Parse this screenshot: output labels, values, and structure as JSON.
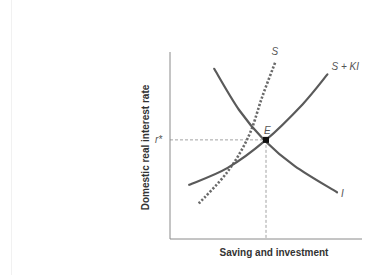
{
  "chart_data": {
    "type": "line",
    "title": "",
    "xlabel": "Saving and investment",
    "ylabel": "Domestic real interest rate",
    "xlim": [
      0,
      10
    ],
    "ylim": [
      0,
      10
    ],
    "grid": false,
    "legend": "none (curves labeled inline)",
    "series": [
      {
        "name": "I",
        "label": "I",
        "style": "solid",
        "description": "Investment demand, downward sloping",
        "points": [
          [
            2.3,
            9.1
          ],
          [
            3.6,
            6.9
          ],
          [
            4.9,
            5.3
          ],
          [
            6.5,
            3.9
          ],
          [
            8.7,
            2.5
          ]
        ]
      },
      {
        "name": "S",
        "label": "S",
        "style": "dotted",
        "description": "Domestic saving supply, steep upward sloping",
        "points": [
          [
            1.5,
            1.9
          ],
          [
            3.0,
            3.6
          ],
          [
            4.1,
            5.5
          ],
          [
            4.8,
            7.6
          ],
          [
            5.5,
            9.5
          ]
        ]
      },
      {
        "name": "S + KI",
        "label": "S + KI",
        "style": "solid",
        "description": "Saving plus capital inflows, flatter upward sloping",
        "points": [
          [
            1.0,
            2.9
          ],
          [
            3.0,
            3.8
          ],
          [
            5.0,
            5.3
          ],
          [
            6.9,
            7.2
          ],
          [
            8.2,
            8.8
          ]
        ]
      }
    ],
    "annotations": [
      {
        "type": "point",
        "label": "E",
        "x": 5.0,
        "y": 5.3,
        "description": "Equilibrium"
      },
      {
        "type": "tick",
        "axis": "y",
        "label": "r*",
        "value": 5.3
      },
      {
        "type": "guide",
        "style": "dashed",
        "from": "r* on y-axis",
        "to": "E"
      },
      {
        "type": "guide",
        "style": "dashed",
        "from": "E",
        "to": "x-axis"
      }
    ]
  }
}
